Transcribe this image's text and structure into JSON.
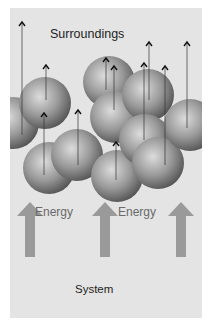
{
  "diagram": {
    "labels": {
      "surroundings": "Surroundings",
      "energy_left": "Energy",
      "energy_right": "Energy",
      "system": "System"
    },
    "colors": {
      "panel_background": "#e4e4e4",
      "energy_arrow": "#9a9a9a",
      "sphere_light": "#d6d6d6",
      "sphere_dark": "#5a5a5a",
      "molecule_arrow": "#333333"
    },
    "spheres": [
      {
        "cx": 13,
        "cy": 123,
        "r": 26
      },
      {
        "cx": 45,
        "cy": 103,
        "r": 26
      },
      {
        "cx": 49,
        "cy": 168,
        "r": 26
      },
      {
        "cx": 77,
        "cy": 155,
        "r": 26
      },
      {
        "cx": 109,
        "cy": 82,
        "r": 26
      },
      {
        "cx": 116,
        "cy": 117,
        "r": 26
      },
      {
        "cx": 117,
        "cy": 176,
        "r": 26
      },
      {
        "cx": 148,
        "cy": 95,
        "r": 26
      },
      {
        "cx": 145,
        "cy": 140,
        "r": 26
      },
      {
        "cx": 158,
        "cy": 163,
        "r": 26
      },
      {
        "cx": 190,
        "cy": 125,
        "r": 26
      }
    ],
    "molecule_arrows": [
      {
        "x": 22,
        "y1": 135,
        "y2": 22
      },
      {
        "x": 46,
        "y1": 100,
        "y2": 65
      },
      {
        "x": 44,
        "y1": 175,
        "y2": 113
      },
      {
        "x": 78,
        "y1": 165,
        "y2": 110
      },
      {
        "x": 106,
        "y1": 90,
        "y2": 58
      },
      {
        "x": 114,
        "y1": 110,
        "y2": 66
      },
      {
        "x": 116,
        "y1": 180,
        "y2": 142
      },
      {
        "x": 149,
        "y1": 100,
        "y2": 42
      },
      {
        "x": 144,
        "y1": 140,
        "y2": 63
      },
      {
        "x": 165,
        "y1": 165,
        "y2": 66
      },
      {
        "x": 187,
        "y1": 128,
        "y2": 42
      }
    ],
    "energy_arrows": [
      {
        "x": 30,
        "top": 202,
        "bottom": 257
      },
      {
        "x": 105,
        "top": 202,
        "bottom": 257
      },
      {
        "x": 181,
        "top": 202,
        "bottom": 257
      }
    ]
  }
}
